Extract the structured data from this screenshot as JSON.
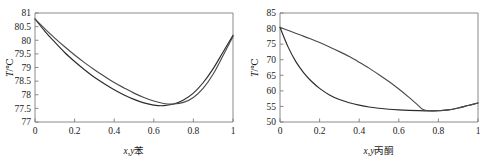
{
  "figure": {
    "background": "#ffffff",
    "panel_count": 2
  },
  "chart_data": [
    {
      "type": "line",
      "panel": "left",
      "title": "",
      "subtitle": "",
      "xlabel": "x,y苯",
      "xlabel_italic_part": "x,y",
      "xlabel_plain_part": "苯",
      "ylabel": "T/℃",
      "ylabel_italic_part": "T",
      "ylabel_plain_part": "/℃",
      "xlim": [
        0,
        1
      ],
      "ylim": [
        77,
        81
      ],
      "xticks": [
        0,
        0.2,
        0.4,
        0.6,
        0.8,
        1
      ],
      "xtick_labels": [
        "0",
        "0.2",
        "0.4",
        "0.6",
        "0.8",
        "1"
      ],
      "yticks": [
        77,
        77.5,
        78,
        78.5,
        79,
        79.5,
        80,
        80.5,
        81
      ],
      "ytick_labels": [
        "77",
        "77.5",
        "78",
        "78.5",
        "79",
        "79.5",
        "80",
        "80.5",
        "81"
      ],
      "grid": false,
      "legend": "none",
      "annotations": [],
      "azeotrope": {
        "x": 0.55,
        "T": 77.55
      },
      "series": [
        {
          "name": "liquid-curve",
          "color": "#2b2b2b",
          "x": [
            0,
            0.05,
            0.1,
            0.15,
            0.2,
            0.25,
            0.3,
            0.35,
            0.4,
            0.45,
            0.5,
            0.55,
            0.6,
            0.65,
            0.7,
            0.75,
            0.8,
            0.85,
            0.9,
            0.95,
            1
          ],
          "values": [
            80.78,
            80.33,
            79.93,
            79.55,
            79.22,
            78.92,
            78.64,
            78.4,
            78.18,
            77.99,
            77.83,
            77.7,
            77.62,
            77.6,
            77.66,
            77.81,
            78.06,
            78.45,
            78.96,
            79.57,
            80.18
          ]
        },
        {
          "name": "vapor-curve",
          "color": "#4a4a4a",
          "x": [
            0,
            0.05,
            0.1,
            0.15,
            0.2,
            0.25,
            0.3,
            0.35,
            0.4,
            0.45,
            0.5,
            0.55,
            0.6,
            0.65,
            0.7,
            0.75,
            0.8,
            0.85,
            0.9,
            0.95,
            1
          ],
          "values": [
            80.78,
            80.42,
            80.08,
            79.76,
            79.46,
            79.18,
            78.92,
            78.68,
            78.45,
            78.25,
            78.06,
            77.9,
            77.77,
            77.68,
            77.66,
            77.72,
            77.9,
            78.24,
            78.76,
            79.44,
            80.14
          ]
        }
      ]
    },
    {
      "type": "line",
      "panel": "right",
      "title": "",
      "subtitle": "",
      "xlabel": "x,y丙酮",
      "xlabel_italic_part": "x,y",
      "xlabel_plain_part": "丙酮",
      "ylabel": "T/℃",
      "ylabel_italic_part": "T",
      "ylabel_plain_part": "/℃",
      "xlim": [
        0,
        1
      ],
      "ylim": [
        50,
        85
      ],
      "xticks": [
        0,
        0.2,
        0.4,
        0.6,
        0.8,
        1
      ],
      "xtick_labels": [
        "0",
        "0.2",
        "0.4",
        "0.6",
        "0.8",
        "1"
      ],
      "yticks": [
        50,
        55,
        60,
        65,
        70,
        75,
        80,
        85
      ],
      "ytick_labels": [
        "50",
        "55",
        "60",
        "65",
        "70",
        "75",
        "80",
        "85"
      ],
      "grid": false,
      "legend": "none",
      "annotations": [],
      "azeotrope": {
        "x": 0.77,
        "T": 53.5
      },
      "series": [
        {
          "name": "liquid-curve",
          "color": "#2b2b2b",
          "x": [
            0,
            0.04,
            0.08,
            0.12,
            0.16,
            0.2,
            0.25,
            0.3,
            0.35,
            0.4,
            0.45,
            0.5,
            0.55,
            0.6,
            0.65,
            0.7,
            0.75,
            0.8,
            0.85,
            0.9,
            0.95,
            1
          ],
          "values": [
            80.4,
            74.2,
            69.4,
            65.8,
            63.0,
            60.8,
            58.7,
            57.2,
            56.2,
            55.4,
            54.8,
            54.4,
            54.1,
            53.9,
            53.75,
            53.65,
            53.58,
            53.6,
            53.9,
            54.5,
            55.3,
            56.1
          ]
        },
        {
          "name": "vapor-curve",
          "color": "#4a4a4a",
          "x": [
            0,
            0.05,
            0.1,
            0.15,
            0.2,
            0.25,
            0.3,
            0.35,
            0.4,
            0.45,
            0.5,
            0.55,
            0.6,
            0.65,
            0.7,
            0.72,
            0.75,
            0.8,
            0.85,
            0.9,
            0.95,
            1
          ],
          "values": [
            80.4,
            79.2,
            78.0,
            76.8,
            75.5,
            74.1,
            72.6,
            71.0,
            69.2,
            67.3,
            65.2,
            63.0,
            60.6,
            58.0,
            55.2,
            54.1,
            53.6,
            53.6,
            53.9,
            54.5,
            55.3,
            56.1
          ]
        }
      ]
    }
  ]
}
